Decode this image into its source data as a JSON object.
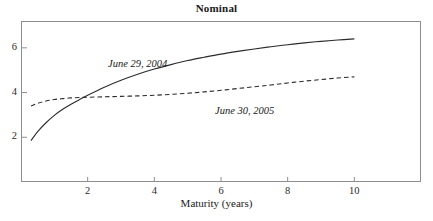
{
  "chart_data": {
    "type": "line",
    "title": "Nominal",
    "xlabel": "Maturity (years)",
    "ylabel": "",
    "xlim": [
      0,
      12
    ],
    "ylim": [
      0,
      7.2
    ],
    "xticks": [
      2,
      4,
      6,
      8,
      10
    ],
    "yticks": [
      2,
      4,
      6
    ],
    "xtick_labels": [
      "2",
      "4",
      "6",
      "8",
      "10"
    ],
    "ytick_labels": [
      "2",
      "4",
      "6"
    ],
    "grid": false,
    "legend_position": "inline-annotation",
    "series": [
      {
        "name": "June 29, 2004",
        "style": "solid",
        "color": "#2b2b2b",
        "annotation": "June 29, 2004",
        "x": [
          0.3,
          0.5,
          0.75,
          1.0,
          1.25,
          1.5,
          1.75,
          2.0,
          2.5,
          3.0,
          3.5,
          4.0,
          4.5,
          5.0,
          5.5,
          6.0,
          6.5,
          7.0,
          7.5,
          8.0,
          8.5,
          9.0,
          9.5,
          10.0
        ],
        "y": [
          1.85,
          2.25,
          2.65,
          2.98,
          3.25,
          3.48,
          3.68,
          3.88,
          4.24,
          4.55,
          4.82,
          5.05,
          5.25,
          5.43,
          5.58,
          5.72,
          5.84,
          5.95,
          6.05,
          6.14,
          6.22,
          6.29,
          6.35,
          6.4
        ]
      },
      {
        "name": "June 30, 2005",
        "style": "dashed",
        "color": "#2b2b2b",
        "annotation": "June 30, 2005",
        "x": [
          0.3,
          0.5,
          0.75,
          1.0,
          1.25,
          1.5,
          1.75,
          2.0,
          2.5,
          3.0,
          3.5,
          4.0,
          4.5,
          5.0,
          5.5,
          6.0,
          6.5,
          7.0,
          7.5,
          8.0,
          8.5,
          9.0,
          9.5,
          10.0
        ],
        "y": [
          3.4,
          3.52,
          3.62,
          3.69,
          3.73,
          3.76,
          3.78,
          3.79,
          3.81,
          3.83,
          3.85,
          3.88,
          3.92,
          3.97,
          4.03,
          4.1,
          4.18,
          4.26,
          4.34,
          4.43,
          4.51,
          4.58,
          4.65,
          4.7
        ]
      }
    ],
    "crossover": {
      "x": 1.8,
      "y": 3.78
    }
  },
  "figure": {
    "title": "Nominal",
    "xlabel": "Maturity (years)",
    "frame_color": "#8e8e8e"
  }
}
